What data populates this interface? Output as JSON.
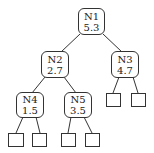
{
  "diagram": {
    "type": "binary-tree",
    "nodes": [
      {
        "id": "N1",
        "label": "N1",
        "value": "5.3",
        "x": 78,
        "y": 8,
        "w": 27,
        "h": 27
      },
      {
        "id": "N2",
        "label": "N2",
        "value": "2.7",
        "x": 41,
        "y": 51,
        "w": 28,
        "h": 27
      },
      {
        "id": "N3",
        "label": "N3",
        "value": "4.7",
        "x": 111,
        "y": 51,
        "w": 28,
        "h": 27
      },
      {
        "id": "N4",
        "label": "N4",
        "value": "1.5",
        "x": 16,
        "y": 92,
        "w": 28,
        "h": 26
      },
      {
        "id": "N5",
        "label": "N5",
        "value": "3.5",
        "x": 64,
        "y": 92,
        "w": 28,
        "h": 26
      }
    ],
    "leaves": [
      {
        "parent": "N3",
        "x": 106,
        "y": 93,
        "w": 15,
        "h": 14
      },
      {
        "parent": "N3",
        "x": 131,
        "y": 93,
        "w": 15,
        "h": 14
      },
      {
        "parent": "N4",
        "x": 8,
        "y": 133,
        "w": 16,
        "h": 14
      },
      {
        "parent": "N4",
        "x": 32,
        "y": 133,
        "w": 15,
        "h": 14
      },
      {
        "parent": "N5",
        "x": 61,
        "y": 133,
        "w": 15,
        "h": 14
      },
      {
        "parent": "N5",
        "x": 85,
        "y": 133,
        "w": 15,
        "h": 14
      }
    ],
    "edges": [
      {
        "from": "N1",
        "to": "N2",
        "x1": 80,
        "y1": 34,
        "x2": 61,
        "y2": 52
      },
      {
        "from": "N1",
        "to": "N3",
        "x1": 103,
        "y1": 34,
        "x2": 122,
        "y2": 52
      },
      {
        "from": "N2",
        "to": "N4",
        "x1": 45,
        "y1": 77,
        "x2": 32,
        "y2": 93
      },
      {
        "from": "N2",
        "to": "N5",
        "x1": 64,
        "y1": 77,
        "x2": 76,
        "y2": 93
      },
      {
        "from": "N3",
        "to": "leaf-1",
        "x1": 119,
        "y1": 77,
        "x2": 113,
        "y2": 93
      },
      {
        "from": "N3",
        "to": "leaf-2",
        "x1": 133,
        "y1": 77,
        "x2": 138,
        "y2": 93
      },
      {
        "from": "N4",
        "to": "leaf-3",
        "x1": 23,
        "y1": 117,
        "x2": 16,
        "y2": 133
      },
      {
        "from": "N4",
        "to": "leaf-4",
        "x1": 36,
        "y1": 117,
        "x2": 40,
        "y2": 133
      },
      {
        "from": "N5",
        "to": "leaf-5",
        "x1": 71,
        "y1": 117,
        "x2": 68,
        "y2": 133
      },
      {
        "from": "N5",
        "to": "leaf-6",
        "x1": 84,
        "y1": 117,
        "x2": 92,
        "y2": 133
      }
    ]
  }
}
